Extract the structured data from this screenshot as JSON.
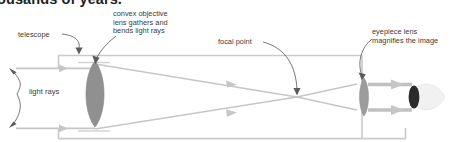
{
  "figure": {
    "title_partial": "ousands of years.",
    "type": "optical-ray-diagram",
    "background_color": "#ffffff",
    "text_color": "#3b3a3a",
    "heading_color": "#221f1f"
  },
  "labels": {
    "telescope": "telescope",
    "objective_line1": "convex objective",
    "objective_line2": "lens gathers and",
    "objective_line3": "bends light rays",
    "focal_point": "focal point",
    "eyepiece_line1": "eyepiece lens",
    "eyepiece_line2": "magnifies the image",
    "light_rays": "light rays"
  },
  "diagram_data": {
    "type": "diagram",
    "elements": [
      {
        "name": "telescope-tube",
        "label": "telescope",
        "color": "#c9c9c9",
        "x_range": [
          58,
          406
        ],
        "y_range": [
          55,
          139
        ]
      },
      {
        "name": "objective-lens",
        "label": "convex objective lens gathers and bends light rays",
        "color": "#8e8e8e",
        "center": [
          95,
          94
        ],
        "width": 25,
        "height": 66
      },
      {
        "name": "focal-point",
        "label": "focal point",
        "position": [
          297,
          97
        ]
      },
      {
        "name": "eyepiece-lens",
        "label": "eyepiece lens magnifies the image",
        "color": "#9a9a9a",
        "center": [
          364,
          97
        ],
        "width": 13,
        "height": 39
      },
      {
        "name": "eye",
        "color": "#f2f2f2",
        "pupil_color": "#2d2d2d",
        "center": [
          424,
          97
        ]
      },
      {
        "name": "incoming-light-rays",
        "label": "light rays",
        "color": "#c3c3c3",
        "y_positions": [
          68,
          128
        ]
      }
    ]
  },
  "colors": {
    "ray": "#c6c6c6",
    "tube": "#cacaca",
    "lens_objective": "#8e8e8e",
    "lens_eyepiece": "#9c9c9c",
    "pointer": "#5d5c5c",
    "eye_white": "#f1f1f1",
    "pupil": "#2b2b2b"
  }
}
